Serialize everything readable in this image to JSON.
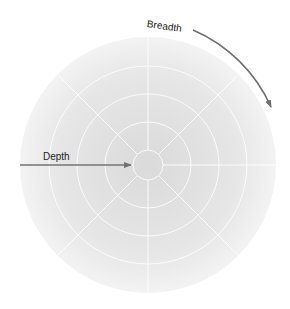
{
  "diagram": {
    "labels": {
      "depth": "Depth",
      "breadth": "Breadth"
    },
    "colors": {
      "disc_center": "#dcdcdc",
      "disc_edge": "#f2f2f2",
      "grid_lines": "#ffffff",
      "arrow": "#707070",
      "text": "#222222"
    },
    "rings": 5,
    "spokes": 8
  }
}
